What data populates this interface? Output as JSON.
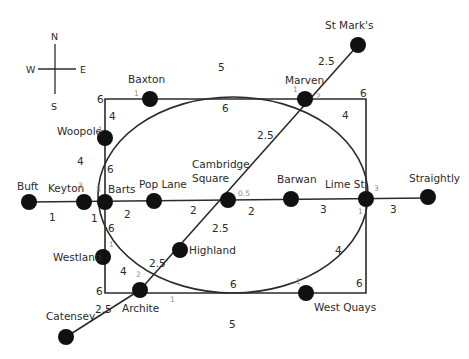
{
  "compass": {
    "n": "N",
    "s": "S",
    "e": "E",
    "w": "W"
  },
  "stations": [
    {
      "id": "baxton",
      "name": "Baxton",
      "degree": "1"
    },
    {
      "id": "marven",
      "name": "Marven",
      "degree_left": "1",
      "degree_right": "2"
    },
    {
      "id": "stmarks",
      "name": "St Mark's"
    },
    {
      "id": "woopole",
      "name": "Woopole",
      "degree": "1"
    },
    {
      "id": "keyton",
      "name": "Keyton",
      "degree": "3"
    },
    {
      "id": "barts",
      "name": "Barts",
      "degree": "3"
    },
    {
      "id": "buft",
      "name": "Buft"
    },
    {
      "id": "poplane",
      "name": "Pop Lane"
    },
    {
      "id": "cambridge",
      "name_line1": "Cambridge",
      "name_line2": "Square",
      "degree": "0.5"
    },
    {
      "id": "barwan",
      "name": "Barwan"
    },
    {
      "id": "limest",
      "name": "Lime St",
      "degree_top": "3",
      "degree_bottom": "1"
    },
    {
      "id": "straightly",
      "name": "Straightly"
    },
    {
      "id": "westland",
      "name": "Westland",
      "degree": "1"
    },
    {
      "id": "archite",
      "name": "Archite",
      "degree_top": "2",
      "degree_right": "1"
    },
    {
      "id": "highland",
      "name": "Highland"
    },
    {
      "id": "westquays",
      "name": "West Quays",
      "degree": "1"
    },
    {
      "id": "catensey",
      "name": "Catensey"
    }
  ],
  "edges": [
    {
      "from": "Baxton",
      "to": "Marven",
      "weight": "5",
      "shape": "arc"
    },
    {
      "from": "Baxton",
      "to": "Marven",
      "weight": "6",
      "shape": "straight"
    },
    {
      "from": "Marven",
      "to": "St Mark's",
      "weight": "2.5"
    },
    {
      "from": "Marven",
      "to": "Cambridge Square",
      "weight": "2.5"
    },
    {
      "from": "Marven",
      "to": "Lime St",
      "weight": "4",
      "shape": "arc"
    },
    {
      "from": "Marven",
      "to": "Lime St",
      "weight": "6",
      "shape": "rectangle-corner"
    },
    {
      "from": "Baxton",
      "to": "Barts",
      "weight": "6",
      "shape": "rectangle-corner"
    },
    {
      "from": "Baxton",
      "to": "Woopole",
      "weight": "4",
      "shape": "arc"
    },
    {
      "from": "Woopole",
      "to": "Keyton",
      "weight": "4",
      "shape": "arc"
    },
    {
      "from": "Woopole",
      "to": "Barts",
      "weight": "6"
    },
    {
      "from": "Buft",
      "to": "Keyton",
      "weight": "1"
    },
    {
      "from": "Keyton",
      "to": "Westland",
      "weight": "1",
      "shape": "arc"
    },
    {
      "from": "Barts",
      "to": "Pop Lane",
      "weight": "2"
    },
    {
      "from": "Barts",
      "to": "Westland",
      "weight": "6"
    },
    {
      "from": "Pop Lane",
      "to": "Cambridge Square",
      "weight": "2"
    },
    {
      "from": "Cambridge Square",
      "to": "Barwan",
      "weight": "2"
    },
    {
      "from": "Barwan",
      "to": "Lime St",
      "weight": "3"
    },
    {
      "from": "Lime St",
      "to": "Straightly",
      "weight": "3"
    },
    {
      "from": "Cambridge Square",
      "to": "Highland",
      "weight": "2.5"
    },
    {
      "from": "Highland",
      "to": "Archite",
      "weight": "2.5"
    },
    {
      "from": "Westland",
      "to": "Archite",
      "weight": "4",
      "shape": "arc"
    },
    {
      "from": "Westland",
      "to": "Archite",
      "weight": "6",
      "shape": "rectangle-corner"
    },
    {
      "from": "Archite",
      "to": "Catensey",
      "weight": "2.5"
    },
    {
      "from": "Archite",
      "to": "West Quays",
      "weight": "6",
      "shape": "straight"
    },
    {
      "from": "Archite",
      "to": "West Quays",
      "weight": "5",
      "shape": "arc"
    },
    {
      "from": "West Quays",
      "to": "Lime St",
      "weight": "4",
      "shape": "arc"
    },
    {
      "from": "West Quays",
      "to": "Lime St",
      "weight": "6",
      "shape": "rectangle-corner"
    }
  ],
  "weights": {
    "baxton_marven_arc": "5",
    "baxton_marven_straight": "6",
    "marven_stmarks": "2.5",
    "marven_cambridge": "2.5",
    "marven_limest_arc": "4",
    "rect_top_right": "6",
    "rect_top_left": "6",
    "baxton_woopole": "4",
    "woopole_keyton": "4",
    "woopole_barts": "6",
    "buft_keyton": "1",
    "keyton_westland": "1",
    "barts_poplane": "2",
    "barts_westland": "6",
    "poplane_cambridge": "2",
    "cambridge_barwan": "2",
    "barwan_limest": "3",
    "limest_straightly": "3",
    "cambridge_highland": "2.5",
    "highland_archite": "2.5",
    "westland_archite": "4",
    "rect_bottom_left": "6",
    "archite_catensey": "2.5",
    "archite_westquays_straight": "6",
    "archite_westquays_arc": "5",
    "westquays_limest_arc": "4",
    "rect_bottom_right": "6"
  }
}
